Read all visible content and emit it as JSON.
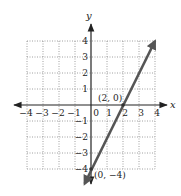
{
  "chart_data": {
    "type": "line",
    "title": "",
    "xlabel": "x",
    "ylabel": "y",
    "xlim": [
      -4,
      4
    ],
    "ylim": [
      -4,
      4
    ],
    "grid": true,
    "grid_style": "dotted",
    "x_ticks": [
      "-4",
      "-3",
      "-2",
      "-1",
      "0",
      "1",
      "2",
      "3",
      "4"
    ],
    "y_ticks": [
      "4",
      "3",
      "2",
      "1",
      "-1",
      "-2",
      "-3",
      "-4"
    ],
    "series": [
      {
        "name": "line",
        "equation": "y = 2x - 4",
        "x": [
          -0.4,
          0,
          2,
          4
        ],
        "y": [
          -4.8,
          -4,
          0,
          4
        ],
        "color": "#555555",
        "arrows_both_ends": true
      }
    ],
    "annotations": [
      {
        "label": "(2, 0)",
        "x": 2,
        "y": 0
      },
      {
        "label": "(0, −4)",
        "x": 0,
        "y": -4
      }
    ]
  },
  "labels": {
    "x_axis": "x",
    "y_axis": "y",
    "point_a": "(2, 0)",
    "point_b": "(0, −4)",
    "zero": "0",
    "x_ticks_neg": [
      "−4",
      "−3",
      "−2",
      "−1"
    ],
    "x_ticks_pos": [
      "1",
      "2",
      "3",
      "4"
    ],
    "y_ticks_pos": [
      "1",
      "2",
      "3",
      "4"
    ],
    "y_ticks_neg": [
      "−1",
      "−2",
      "−3",
      "−4"
    ]
  },
  "colors": {
    "axis": "#222222",
    "grid": "#888888",
    "line": "#555555",
    "background": "#ffffff"
  }
}
